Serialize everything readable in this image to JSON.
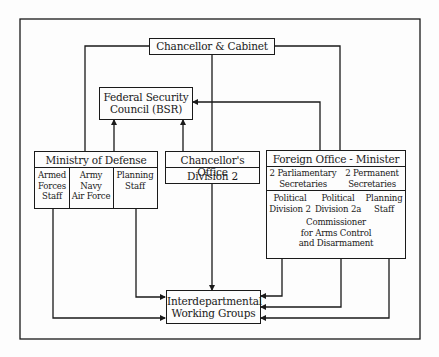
{
  "diagram": {
    "nodes": {
      "chancellor_cabinet": {
        "label": "Chancellor & Cabinet"
      },
      "bsr": {
        "line1": "Federal Security",
        "line2": "Council (BSR)"
      },
      "mod": {
        "title": "Ministry of Defense",
        "col1": [
          "Armed",
          "Forces",
          "Staff"
        ],
        "col2": [
          "Army",
          "Navy",
          "Air Force"
        ],
        "col3": [
          "Planning",
          "Staff"
        ]
      },
      "chancellors_office": {
        "title": "Chancellor's Office",
        "sub": "Division 2"
      },
      "foreign_office": {
        "title": "Foreign Office - Minister",
        "parl": [
          "2 Parliamentary",
          "Secretaries"
        ],
        "perm": [
          "2 Permanent",
          "Secretaries"
        ],
        "pol2": [
          "Political",
          "Division 2"
        ],
        "pol2a": [
          "Political",
          "Division 2a"
        ],
        "plan": [
          "Planning",
          "Staff"
        ],
        "commissioner": [
          "Commissioner",
          "for Arms Control",
          "and Disarmament"
        ]
      },
      "iwg": {
        "line1": "Interdepartmental",
        "line2": "Working Groups"
      }
    },
    "edges": [
      {
        "from": "Chancellor & Cabinet",
        "to": "Ministry of Defense"
      },
      {
        "from": "Chancellor & Cabinet",
        "to": "Foreign Office - Minister"
      },
      {
        "from": "Chancellor & Cabinet",
        "to": "Interdepartmental Working Groups"
      },
      {
        "from": "Ministry of Defense",
        "to": "Federal Security Council (BSR)"
      },
      {
        "from": "Chancellor's Office",
        "to": "Federal Security Council (BSR)"
      },
      {
        "from": "Foreign Office - Minister",
        "to": "Federal Security Council (BSR)"
      },
      {
        "from": "Armed Forces Staff",
        "to": "Interdepartmental Working Groups"
      },
      {
        "from": "MoD Planning Staff",
        "to": "Interdepartmental Working Groups"
      },
      {
        "from": "Foreign Office (3 lines)",
        "to": "Interdepartmental Working Groups"
      },
      {
        "from": "Chancellor & Cabinet (outer frame)",
        "to": "all"
      }
    ]
  }
}
